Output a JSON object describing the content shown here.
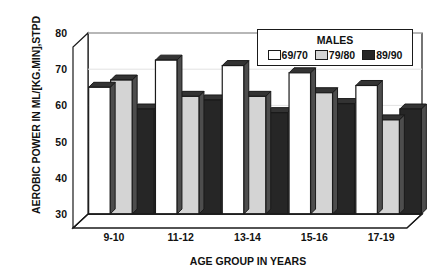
{
  "chart_data": {
    "type": "bar",
    "title": "",
    "xlabel": "AGE GROUP IN YEARS",
    "ylabel": "AEROBIC POWER IN ML/[KG.MIN],STPD",
    "categories": [
      "9-10",
      "11-12",
      "13-14",
      "15-16",
      "17-19"
    ],
    "ylim": [
      30,
      80
    ],
    "yticks": [
      30,
      40,
      50,
      60,
      70,
      80
    ],
    "ytick_labels": [
      "30",
      "40",
      "50",
      "60",
      "70",
      "80"
    ],
    "grid": false,
    "legend_position": "top-right",
    "legend_title": "MALES",
    "series": [
      {
        "name": "69/70",
        "color": "#ffffff",
        "values": [
          65,
          72.5,
          71,
          69,
          65.5
        ]
      },
      {
        "name": "79/80",
        "color": "#d4d4d4",
        "values": [
          67,
          62.5,
          62.5,
          63.5,
          56
        ]
      },
      {
        "name": "89/90",
        "color": "#262626",
        "values": [
          59,
          61.5,
          58,
          60.5,
          59
        ]
      }
    ]
  },
  "axes": {
    "y_title": "AEROBIC POWER IN ML/[KG.MIN],STPD",
    "x_title": "AGE GROUP IN YEARS"
  },
  "legend": {
    "title": "MALES",
    "items": [
      {
        "label": "69/70",
        "color": "#ffffff"
      },
      {
        "label": "79/80",
        "color": "#d4d4d4"
      },
      {
        "label": "89/90",
        "color": "#262626"
      }
    ]
  },
  "style": {
    "outline": "#1a1a1a",
    "floor": "#ffffff",
    "bar_top_shade": "#333333",
    "bar_side_shade": "#4d4d4d"
  }
}
